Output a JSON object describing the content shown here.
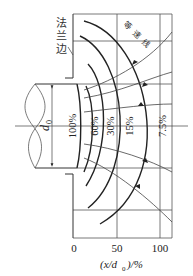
{
  "figure": {
    "type": "jet velocity distribution diagram",
    "flange_label": [
      "法",
      "兰",
      "边"
    ],
    "isovelocity_label": [
      "等",
      "速",
      "线"
    ],
    "diameter_label": "d",
    "diameter_subscript": "0",
    "isovelocity_percent_labels": [
      "100%",
      "60%",
      "30%",
      "15%",
      "7.5%"
    ],
    "x_axis": {
      "ticks": [
        "0",
        "50",
        "100"
      ],
      "label_prefix": "(x/d",
      "label_subscript": "0",
      "label_suffix": ")/%"
    },
    "colors": {
      "line": "#222222",
      "grid": "#555555",
      "background": "#ffffff"
    }
  }
}
